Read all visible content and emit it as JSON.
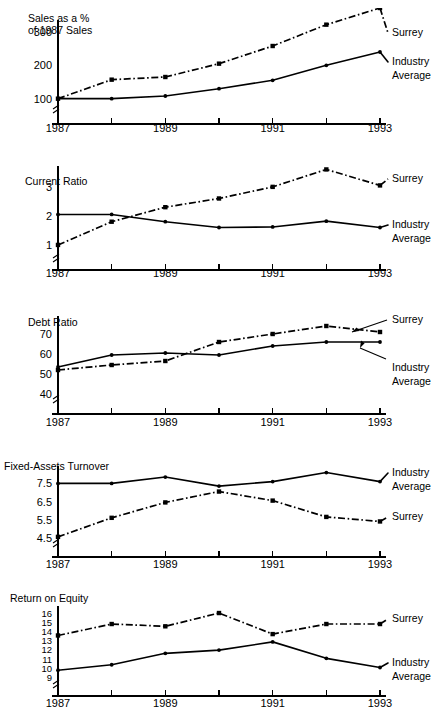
{
  "page": {
    "background": "#ffffff",
    "ink": "#000000",
    "width": 444,
    "height": 719
  },
  "legend": {
    "surrey_label": "Surrey",
    "industry_line1": "Industry",
    "industry_line2": "Average",
    "surrey_style": "dash-dot",
    "industry_style": "solid"
  },
  "shared": {
    "x_tick_labels": [
      "1987",
      "",
      "1989",
      "",
      "1991",
      "",
      "1993"
    ],
    "x_values": [
      1987,
      1988,
      1989,
      1990,
      1991,
      1992,
      1993
    ],
    "axis_break_symbol": "axis-break"
  },
  "chart_data": [
    {
      "id": "sales-percent",
      "type": "line",
      "title": "Sales as a %\nof 1987 Sales",
      "title_line1": "Sales as a %",
      "title_line2": "of 1987 Sales",
      "xlabel": "",
      "ylabel": "",
      "x": [
        1987,
        1988,
        1989,
        1990,
        1991,
        1992,
        1993
      ],
      "xtick_labels": [
        "1987",
        "1989",
        "1991",
        "1993"
      ],
      "ytick_labels": [
        "100",
        "200",
        "300"
      ],
      "ytick_values": [
        100,
        200,
        300
      ],
      "ylim": [
        60,
        330
      ],
      "grid": false,
      "legend_position": "right",
      "series": [
        {
          "name": "Surrey",
          "style": "dash-dot",
          "marker": "square",
          "values": [
            100,
            157,
            165,
            205,
            258,
            322,
            372
          ]
        },
        {
          "name": "Industry Average",
          "style": "solid",
          "marker": "round",
          "values": [
            100,
            100,
            108,
            130,
            155,
            200,
            240
          ]
        }
      ]
    },
    {
      "id": "current-ratio",
      "type": "line",
      "title": "Current Ratio",
      "title_line1": "Current Ratio",
      "title_line2": "",
      "xlabel": "",
      "ylabel": "",
      "x": [
        1987,
        1988,
        1989,
        1990,
        1991,
        1992,
        1993
      ],
      "xtick_labels": [
        "1987",
        "1989",
        "1991",
        "1993"
      ],
      "ytick_labels": [
        "1",
        "2",
        "3"
      ],
      "ytick_values": [
        1,
        2,
        3
      ],
      "ylim": [
        0.55,
        3.65
      ],
      "grid": false,
      "legend_position": "right",
      "series": [
        {
          "name": "Surrey",
          "style": "dash-dot",
          "marker": "square",
          "values": [
            1.0,
            1.8,
            2.3,
            2.6,
            3.0,
            3.6,
            3.05
          ]
        },
        {
          "name": "Industry Average",
          "style": "solid",
          "marker": "round",
          "values": [
            2.05,
            2.05,
            1.8,
            1.6,
            1.62,
            1.82,
            1.6
          ]
        }
      ]
    },
    {
      "id": "debt-ratio",
      "type": "line",
      "title": "Debt Ratio",
      "title_line1": "Debt Ratio",
      "title_line2": "",
      "xlabel": "",
      "ylabel": "",
      "x": [
        1987,
        1988,
        1989,
        1990,
        1991,
        1992,
        1993
      ],
      "xtick_labels": [
        "1987",
        "1989",
        "1991",
        "1993"
      ],
      "ytick_labels": [
        "40",
        "50",
        "60",
        "70"
      ],
      "ytick_values": [
        40,
        50,
        60,
        70
      ],
      "ylim": [
        36,
        78
      ],
      "grid": false,
      "legend_position": "right-annotated",
      "annotations": [
        {
          "label": "Surrey",
          "points_to": "surrey-1992-1993-segment"
        },
        {
          "label": "Industry Average",
          "points_to": "industry-1993-segment"
        }
      ],
      "series": [
        {
          "name": "Surrey",
          "style": "dash-dot",
          "marker": "square",
          "values": [
            52,
            54.5,
            56.5,
            66,
            70,
            74,
            71
          ]
        },
        {
          "name": "Industry Average",
          "style": "solid",
          "marker": "round",
          "values": [
            53.5,
            59.5,
            60.5,
            59.5,
            64,
            66,
            66
          ]
        }
      ]
    },
    {
      "id": "fixed-assets-turnover",
      "type": "line",
      "title": "Fixed-Assets Turnover",
      "title_line1": "Fixed-Assets Turnover",
      "title_line2": "",
      "xlabel": "",
      "ylabel": "",
      "x": [
        1987,
        1988,
        1989,
        1990,
        1991,
        1992,
        1993
      ],
      "xtick_labels": [
        "1987",
        "1989",
        "1991",
        "1993"
      ],
      "ytick_labels": [
        "4.5",
        "5.5",
        "6.5",
        "7.5"
      ],
      "ytick_values": [
        4.5,
        5.5,
        6.5,
        7.5
      ],
      "ylim": [
        4.1,
        8.35
      ],
      "grid": false,
      "legend_position": "right",
      "series": [
        {
          "name": "Industry Average",
          "style": "solid",
          "marker": "round",
          "values": [
            7.5,
            7.5,
            7.85,
            7.35,
            7.6,
            8.1,
            7.6
          ]
        },
        {
          "name": "Surrey",
          "style": "dash-dot",
          "marker": "square",
          "values": [
            4.55,
            5.6,
            6.45,
            7.05,
            6.55,
            5.65,
            5.4
          ]
        }
      ]
    },
    {
      "id": "return-on-equity",
      "type": "line",
      "title": "Return on Equity",
      "title_line1": "Return on Equity",
      "title_line2": "",
      "xlabel": "",
      "ylabel": "",
      "x": [
        1987,
        1988,
        1989,
        1990,
        1991,
        1992,
        1993
      ],
      "xtick_labels": [
        "1987",
        "1989",
        "1991",
        "1993"
      ],
      "ytick_labels": [
        "9",
        "10",
        "11",
        "12",
        "13",
        "14",
        "15",
        "16"
      ],
      "ytick_values": [
        9,
        10,
        11,
        12,
        13,
        14,
        15,
        16
      ],
      "ylim": [
        8.3,
        16.6
      ],
      "grid": false,
      "legend_position": "right",
      "series": [
        {
          "name": "Surrey",
          "style": "dash-dot",
          "marker": "square",
          "values": [
            13.6,
            14.85,
            14.6,
            16.05,
            13.75,
            14.85,
            14.85
          ]
        },
        {
          "name": "Industry Average",
          "style": "solid",
          "marker": "round",
          "values": [
            9.8,
            10.4,
            11.65,
            12.0,
            12.9,
            11.1,
            10.1
          ]
        }
      ]
    }
  ]
}
